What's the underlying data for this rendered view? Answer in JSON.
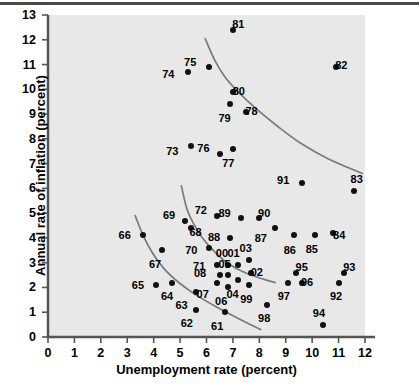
{
  "chart_data": {
    "type": "scatter",
    "title": "",
    "xlabel": "Unemployment rate (percent)",
    "ylabel": "Annual rate of inflation (percent)",
    "xlim": [
      0,
      12
    ],
    "ylim": [
      0,
      13
    ],
    "xticks": [
      0,
      1,
      2,
      3,
      4,
      5,
      6,
      7,
      8,
      9,
      10,
      11,
      12
    ],
    "yticks": [
      0,
      1,
      2,
      3,
      4,
      5,
      6,
      7,
      8,
      9,
      10,
      11,
      12,
      13
    ],
    "grid": false,
    "legend": "none",
    "point_label_field": "year",
    "points": [
      {
        "year": "61",
        "x": 6.7,
        "y": 1.0,
        "lx": -0.3,
        "ly": -0.55
      },
      {
        "year": "62",
        "x": 5.6,
        "y": 1.1,
        "lx": -0.35,
        "ly": -0.55
      },
      {
        "year": "63",
        "x": 5.6,
        "y": 1.8,
        "lx": -0.55,
        "ly": -0.5
      },
      {
        "year": "64",
        "x": 4.7,
        "y": 2.2,
        "lx": -0.2,
        "ly": -0.55
      },
      {
        "year": "65",
        "x": 4.1,
        "y": 2.1,
        "lx": -0.7,
        "ly": 0.0
      },
      {
        "year": "66",
        "x": 3.6,
        "y": 4.1,
        "lx": -0.7,
        "ly": 0.02
      },
      {
        "year": "67",
        "x": 4.3,
        "y": 3.5,
        "lx": -0.25,
        "ly": -0.55
      },
      {
        "year": "68",
        "x": 5.4,
        "y": 4.4,
        "lx": 0.18,
        "ly": -0.18
      },
      {
        "year": "69",
        "x": 5.2,
        "y": 4.7,
        "lx": -0.62,
        "ly": 0.22
      },
      {
        "year": "70",
        "x": 6.1,
        "y": 3.6,
        "lx": -0.68,
        "ly": -0.08
      },
      {
        "year": "71",
        "x": 6.4,
        "y": 2.9,
        "lx": -0.68,
        "ly": -0.05
      },
      {
        "year": "72",
        "x": 6.4,
        "y": 4.9,
        "lx": -0.62,
        "ly": 0.22
      },
      {
        "year": "73",
        "x": 5.4,
        "y": 7.7,
        "lx": -0.7,
        "ly": -0.18
      },
      {
        "year": "74",
        "x": 5.3,
        "y": 10.7,
        "lx": -0.75,
        "ly": -0.1
      },
      {
        "year": "75",
        "x": 6.1,
        "y": 10.9,
        "lx": -0.72,
        "ly": 0.22
      },
      {
        "year": "76",
        "x": 6.5,
        "y": 7.4,
        "lx": -0.62,
        "ly": 0.22
      },
      {
        "year": "77",
        "x": 7.0,
        "y": 7.6,
        "lx": -0.18,
        "ly": -0.58
      },
      {
        "year": "78",
        "x": 7.5,
        "y": 9.1,
        "lx": 0.2,
        "ly": 0.04
      },
      {
        "year": "79",
        "x": 6.9,
        "y": 9.4,
        "lx": -0.22,
        "ly": -0.55
      },
      {
        "year": "80",
        "x": 7.0,
        "y": 9.9,
        "lx": 0.22,
        "ly": 0.05
      },
      {
        "year": "81",
        "x": 7.0,
        "y": 12.4,
        "lx": 0.2,
        "ly": 0.22
      },
      {
        "year": "82",
        "x": 10.9,
        "y": 10.9,
        "lx": 0.2,
        "ly": 0.1
      },
      {
        "year": "83",
        "x": 11.6,
        "y": 5.9,
        "lx": 0.08,
        "ly": 0.48
      },
      {
        "year": "84",
        "x": 10.8,
        "y": 4.2,
        "lx": 0.22,
        "ly": -0.1
      },
      {
        "year": "85",
        "x": 10.1,
        "y": 4.1,
        "lx": -0.12,
        "ly": -0.55
      },
      {
        "year": "86",
        "x": 9.3,
        "y": 4.1,
        "lx": -0.15,
        "ly": -0.58
      },
      {
        "year": "87",
        "x": 8.6,
        "y": 4.4,
        "lx": -0.55,
        "ly": -0.42
      },
      {
        "year": "88",
        "x": 6.9,
        "y": 4.0,
        "lx": -0.62,
        "ly": 0.04
      },
      {
        "year": "89",
        "x": 7.3,
        "y": 4.8,
        "lx": -0.62,
        "ly": 0.22
      },
      {
        "year": "90",
        "x": 8.0,
        "y": 4.8,
        "lx": 0.18,
        "ly": 0.22
      },
      {
        "year": "91",
        "x": 9.6,
        "y": 6.2,
        "lx": -0.7,
        "ly": 0.14
      },
      {
        "year": "92",
        "x": 11.0,
        "y": 2.2,
        "lx": -0.1,
        "ly": -0.55
      },
      {
        "year": "93",
        "x": 11.2,
        "y": 2.6,
        "lx": 0.2,
        "ly": 0.24
      },
      {
        "year": "94",
        "x": 10.4,
        "y": 0.5,
        "lx": -0.15,
        "ly": 0.48
      },
      {
        "year": "95",
        "x": 9.4,
        "y": 2.6,
        "lx": 0.2,
        "ly": 0.22
      },
      {
        "year": "96",
        "x": 9.6,
        "y": 2.2,
        "lx": 0.2,
        "ly": 0.02
      },
      {
        "year": "97",
        "x": 9.1,
        "y": 2.2,
        "lx": -0.18,
        "ly": -0.55
      },
      {
        "year": "98",
        "x": 8.3,
        "y": 1.3,
        "lx": -0.12,
        "ly": -0.55
      },
      {
        "year": "99",
        "x": 7.6,
        "y": 2.1,
        "lx": -0.1,
        "ly": -0.58
      },
      {
        "year": "00",
        "x": 6.8,
        "y": 2.9,
        "lx": -0.22,
        "ly": 0.48
      },
      {
        "year": "01",
        "x": 7.2,
        "y": 2.9,
        "lx": -0.18,
        "ly": 0.48
      },
      {
        "year": "02",
        "x": 7.7,
        "y": 2.6,
        "lx": 0.2,
        "ly": 0.02
      },
      {
        "year": "03",
        "x": 7.6,
        "y": 3.1,
        "lx": -0.12,
        "ly": 0.48
      },
      {
        "year": "04",
        "x": 7.2,
        "y": 2.3,
        "lx": -0.22,
        "ly": -0.55
      },
      {
        "year": "05",
        "x": 6.8,
        "y": 2.5,
        "lx": -0.12,
        "ly": 0.45
      },
      {
        "year": "06",
        "x": 6.8,
        "y": 2.0,
        "lx": -0.25,
        "ly": -0.55
      },
      {
        "year": "07",
        "x": 6.4,
        "y": 2.2,
        "lx": -0.55,
        "ly": -0.45
      },
      {
        "year": "08",
        "x": 6.5,
        "y": 2.5,
        "lx": -0.75,
        "ly": 0.08
      }
    ],
    "curves": [
      {
        "name": "upper-phillips-curve",
        "points": [
          [
            5.95,
            12.05
          ],
          [
            6.3,
            11.2
          ],
          [
            6.7,
            10.5
          ],
          [
            7.2,
            9.9
          ],
          [
            7.9,
            9.2
          ],
          [
            8.7,
            8.5
          ],
          [
            9.6,
            7.8
          ],
          [
            10.6,
            7.2
          ],
          [
            11.9,
            6.6
          ]
        ]
      },
      {
        "name": "middle-phillips-curve",
        "points": [
          [
            5.05,
            6.1
          ],
          [
            5.25,
            5.2
          ],
          [
            5.5,
            4.6
          ],
          [
            5.85,
            4.0
          ],
          [
            6.3,
            3.45
          ],
          [
            6.85,
            2.95
          ],
          [
            7.45,
            2.6
          ],
          [
            8.1,
            2.35
          ],
          [
            8.6,
            2.2
          ]
        ]
      },
      {
        "name": "lower-phillips-curve",
        "points": [
          [
            3.3,
            4.9
          ],
          [
            3.6,
            4.1
          ],
          [
            3.95,
            3.4
          ],
          [
            4.4,
            2.75
          ],
          [
            4.95,
            2.2
          ],
          [
            5.6,
            1.7
          ],
          [
            6.4,
            1.2
          ],
          [
            7.2,
            0.75
          ],
          [
            8.05,
            0.3
          ]
        ]
      }
    ]
  },
  "axes": {
    "x_title": "Unemployment rate (percent)",
    "y_title": "Annual rate of inflation (percent)",
    "x_tick_labels": [
      "0",
      "1",
      "2",
      "3",
      "4",
      "5",
      "6",
      "7",
      "8",
      "9",
      "10",
      "11",
      "12"
    ],
    "y_tick_labels": [
      "0",
      "1",
      "2",
      "3",
      "4",
      "5",
      "6",
      "7",
      "8",
      "9",
      "10",
      "11",
      "12",
      "13"
    ]
  },
  "style": {
    "panel_bg": "#e8e8e8",
    "curve_color": "#7a7a7a",
    "dot_color": "#111111",
    "axis_color": "#555555",
    "text_color": "#000000"
  }
}
